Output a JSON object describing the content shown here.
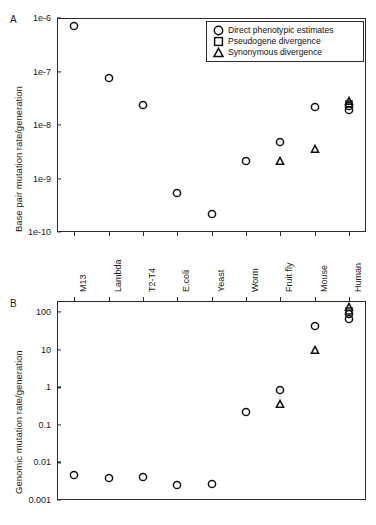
{
  "figure": {
    "background": "#ffffff",
    "ink": "#2b2b2b",
    "categories": [
      "M13",
      "Lambda",
      "T2-T4",
      "E.coli",
      "Yeast",
      "Worm",
      "Fruit fly",
      "Mouse",
      "Human"
    ]
  },
  "legend": {
    "position": "top-right-of-panel-A",
    "entries": [
      {
        "symbol": "circle",
        "icon": "circle-marker-icon",
        "label": "Direct phenotypic estimates"
      },
      {
        "symbol": "square",
        "icon": "square-marker-icon",
        "label": "Pseudogene divergence"
      },
      {
        "symbol": "triangle",
        "icon": "triangle-marker-icon",
        "label": "Synonymous divergence"
      }
    ]
  },
  "panelA": {
    "letter": "A",
    "ylabel": "Base pair mutation rate/generation",
    "yticks": [
      "1e-6",
      "1e-7",
      "1e-8",
      "1e-9",
      "1e-10"
    ],
    "xticks": [
      "M13",
      "Lambda",
      "T2-T4",
      "E.coli",
      "Yeast",
      "Worm",
      "Fruit fly",
      "Mouse",
      "Human"
    ]
  },
  "panelB": {
    "letter": "B",
    "ylabel": "Genomic mutation rate/generation",
    "yticks": [
      "100",
      "10",
      "1",
      "0.1",
      "0.01",
      "0.001"
    ],
    "xticks": [
      "M13",
      "Lambda",
      "T2-T4",
      "E.coli",
      "Yeast",
      "Worm",
      "Fruit fly",
      "Mouse",
      "Human"
    ]
  },
  "chart_data": [
    {
      "type": "scatter",
      "panel": "A",
      "title": "Base pair mutation rate per generation across organisms",
      "xlabel": "",
      "ylabel": "Base pair mutation rate/generation",
      "xscale": "category",
      "yscale": "log",
      "ylim": [
        1e-10,
        1e-06
      ],
      "ytick_values": [
        1e-06,
        1e-07,
        1e-08,
        1e-09,
        1e-10
      ],
      "ytick_labels": [
        "1e-6",
        "1e-7",
        "1e-8",
        "1e-9",
        "1e-10"
      ],
      "categories": [
        "M13",
        "Lambda",
        "T2-T4",
        "E.coli",
        "Yeast",
        "Worm",
        "Fruit fly",
        "Mouse",
        "Human"
      ],
      "grid": false,
      "legend": "inside top right",
      "series": [
        {
          "name": "Direct phenotypic estimates",
          "marker": "circle",
          "points": [
            {
              "category": "M13",
              "value": 7.2e-07
            },
            {
              "category": "Lambda",
              "value": 7.7e-08
            },
            {
              "category": "T2-T4",
              "value": 2.4e-08
            },
            {
              "category": "E.coli",
              "value": 5.4e-10
            },
            {
              "category": "Yeast",
              "value": 2.2e-10
            },
            {
              "category": "Worm",
              "value": 2.1e-09
            },
            {
              "category": "Fruit fly",
              "value": 4.9e-09
            },
            {
              "category": "Mouse",
              "value": 2.2e-08
            },
            {
              "category": "Human",
              "value": 2.3e-08
            },
            {
              "category": "Human",
              "value": 1.9e-08
            }
          ]
        },
        {
          "name": "Pseudogene divergence",
          "marker": "square",
          "points": [
            {
              "category": "Human",
              "value": 2.5e-08
            }
          ]
        },
        {
          "name": "Synonymous divergence",
          "marker": "triangle",
          "points": [
            {
              "category": "Fruit fly",
              "value": 2.1e-09
            },
            {
              "category": "Mouse",
              "value": 3.6e-09
            },
            {
              "category": "Human",
              "value": 2.8e-08
            }
          ]
        }
      ]
    },
    {
      "type": "scatter",
      "panel": "B",
      "title": "Genomic mutation rate per generation across organisms",
      "xlabel": "",
      "ylabel": "Genomic mutation rate/generation",
      "xscale": "category",
      "yscale": "log",
      "ylim": [
        0.001,
        200
      ],
      "ytick_values": [
        100,
        10,
        1,
        0.1,
        0.01,
        0.001
      ],
      "ytick_labels": [
        "100",
        "10",
        "1",
        "0.1",
        "0.01",
        "0.001"
      ],
      "categories": [
        "M13",
        "Lambda",
        "T2-T4",
        "E.coli",
        "Yeast",
        "Worm",
        "Fruit fly",
        "Mouse",
        "Human"
      ],
      "grid": false,
      "legend": "none",
      "series": [
        {
          "name": "Direct phenotypic estimates",
          "marker": "circle",
          "points": [
            {
              "category": "M13",
              "value": 0.0047
            },
            {
              "category": "Lambda",
              "value": 0.0039
            },
            {
              "category": "T2-T4",
              "value": 0.0042
            },
            {
              "category": "E.coli",
              "value": 0.0025
            },
            {
              "category": "Yeast",
              "value": 0.0027
            },
            {
              "category": "Worm",
              "value": 0.22
            },
            {
              "category": "Fruit fly",
              "value": 0.86
            },
            {
              "category": "Mouse",
              "value": 42
            },
            {
              "category": "Human",
              "value": 90
            },
            {
              "category": "Human",
              "value": 68
            }
          ]
        },
        {
          "name": "Pseudogene divergence",
          "marker": "square",
          "points": [
            {
              "category": "Human",
              "value": 110
            }
          ]
        },
        {
          "name": "Synonymous divergence",
          "marker": "triangle",
          "points": [
            {
              "category": "Fruit fly",
              "value": 0.35
            },
            {
              "category": "Mouse",
              "value": 10
            },
            {
              "category": "Human",
              "value": 140
            }
          ]
        }
      ]
    }
  ]
}
